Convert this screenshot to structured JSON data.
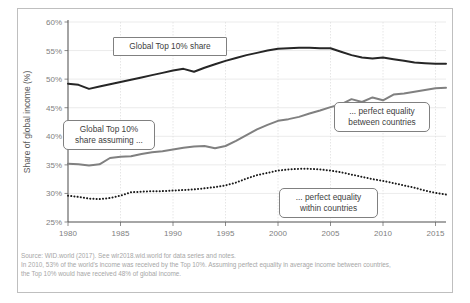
{
  "figure": {
    "background_color": "#ffffff",
    "frame_color": "#bfbfbf"
  },
  "notes": {
    "line1": "Source: WID.world (2017). See wir2018.wid.world for data series and notes.",
    "line2": "In 2010, 53% of the world's income was received by the Top 10%. Assuming perfect equality in average income between countries,",
    "line3": "the Top 10% would have received 48% of global income."
  },
  "callouts": {
    "top_share": "Global Top 10% share",
    "assuming": "Global Top 10%\nshare assuming ...",
    "between": "... perfect equality\nbetween countries",
    "within": "... perfect equality\nwithin countries"
  },
  "chart_data": {
    "type": "line",
    "title": "",
    "xlabel": "",
    "ylabel": "Share of global income (%)",
    "xlim": [
      1980,
      2016
    ],
    "ylim": [
      25,
      60
    ],
    "yticks": [
      "25%",
      "30%",
      "35%",
      "40%",
      "45%",
      "50%",
      "55%",
      "60%"
    ],
    "ytick_values": [
      25,
      30,
      35,
      40,
      45,
      50,
      55,
      60
    ],
    "xticks": [
      "1980",
      "1985",
      "1990",
      "1995",
      "2000",
      "2005",
      "2010",
      "2015"
    ],
    "xtick_values": [
      1980,
      1985,
      1990,
      1995,
      2000,
      2005,
      2010,
      2015
    ],
    "grid": true,
    "legend_position": "annotations",
    "x": [
      1980,
      1981,
      1982,
      1983,
      1984,
      1985,
      1986,
      1987,
      1988,
      1989,
      1990,
      1991,
      1992,
      1993,
      1994,
      1995,
      1996,
      1997,
      1998,
      1999,
      2000,
      2001,
      2002,
      2003,
      2004,
      2005,
      2006,
      2007,
      2008,
      2009,
      2010,
      2011,
      2012,
      2013,
      2014,
      2015,
      2016
    ],
    "series": [
      {
        "name": "Global Top 10% share",
        "color": "#262626",
        "style": "solid",
        "width": 2.0,
        "values": [
          49.2,
          49.0,
          48.3,
          48.7,
          49.1,
          49.5,
          49.9,
          50.3,
          50.7,
          51.1,
          51.5,
          51.8,
          51.3,
          52.0,
          52.6,
          53.2,
          53.7,
          54.2,
          54.6,
          55.0,
          55.3,
          55.4,
          55.5,
          55.5,
          55.4,
          55.4,
          54.8,
          54.2,
          53.8,
          53.6,
          53.8,
          53.5,
          53.2,
          52.9,
          52.8,
          52.7,
          52.7
        ]
      },
      {
        "name": "... perfect equality between countries",
        "color": "#808080",
        "style": "solid",
        "width": 2.0,
        "values": [
          35.2,
          35.1,
          34.9,
          35.1,
          36.2,
          36.4,
          36.5,
          36.9,
          37.2,
          37.4,
          37.7,
          38.0,
          38.2,
          38.3,
          37.9,
          38.3,
          39.2,
          40.2,
          41.2,
          42.0,
          42.7,
          43.0,
          43.4,
          44.0,
          44.5,
          45.1,
          45.6,
          46.5,
          46.0,
          46.8,
          46.3,
          47.3,
          47.5,
          47.8,
          48.1,
          48.4,
          48.5
        ]
      },
      {
        "name": "... perfect equality within countries",
        "color": "#1a1a1a",
        "style": "dotted",
        "width": 2.0,
        "values": [
          29.6,
          29.4,
          29.1,
          29.0,
          29.2,
          29.6,
          30.2,
          30.3,
          30.4,
          30.4,
          30.5,
          30.6,
          30.7,
          30.9,
          31.1,
          31.4,
          31.9,
          32.6,
          33.2,
          33.6,
          34.0,
          34.2,
          34.3,
          34.3,
          34.2,
          34.0,
          33.7,
          33.3,
          32.9,
          32.5,
          32.2,
          31.8,
          31.4,
          31.0,
          30.5,
          30.1,
          29.8
        ]
      }
    ]
  }
}
